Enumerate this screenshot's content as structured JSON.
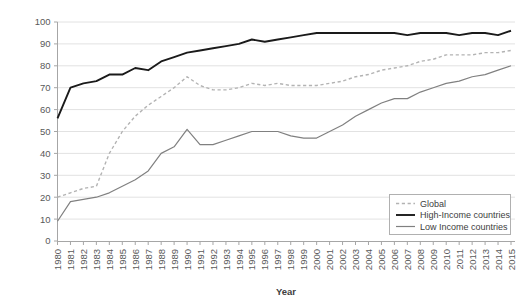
{
  "chart_data": {
    "type": "line",
    "title": "",
    "xlabel": "Year",
    "ylabel": "",
    "ylim": [
      0,
      100
    ],
    "ytick_step": 10,
    "yticks": [
      0,
      10,
      20,
      30,
      40,
      50,
      60,
      70,
      80,
      90,
      100
    ],
    "grid": true,
    "legend_position": "bottom-right",
    "x": [
      1980,
      1981,
      1982,
      1983,
      1984,
      1985,
      1986,
      1987,
      1988,
      1989,
      1990,
      1991,
      1992,
      1993,
      1994,
      1995,
      1996,
      1997,
      1998,
      1999,
      2000,
      2001,
      2002,
      2003,
      2004,
      2005,
      2006,
      2007,
      2008,
      2009,
      2010,
      2011,
      2012,
      2013,
      2014,
      2015
    ],
    "categories": [
      "1980",
      "1981",
      "1982",
      "1983",
      "1984",
      "1985",
      "1986",
      "1987",
      "1988",
      "1989",
      "1990",
      "1991",
      "1992",
      "1993",
      "1994",
      "1995",
      "1996",
      "1997",
      "1998",
      "1999",
      "2000",
      "2001",
      "2002",
      "2003",
      "2004",
      "2005",
      "2006",
      "2007",
      "2008",
      "2009",
      "2010",
      "2011",
      "2012",
      "2013",
      "2014",
      "2015"
    ],
    "series": [
      {
        "name": "Global",
        "style": "dashed",
        "color": "#b3b3b3",
        "width": 1.4,
        "values": [
          20,
          22,
          24,
          25,
          40,
          50,
          57,
          62,
          66,
          70,
          75,
          71,
          69,
          69,
          70,
          72,
          71,
          72,
          71,
          71,
          71,
          72,
          73,
          75,
          76,
          78,
          79,
          80,
          82,
          83,
          85,
          85,
          85,
          86,
          86,
          87
        ]
      },
      {
        "name": "High-Income countries",
        "style": "solid",
        "color": "#1a1a1a",
        "width": 1.9,
        "values": [
          56,
          70,
          72,
          73,
          76,
          76,
          79,
          78,
          82,
          84,
          86,
          87,
          88,
          89,
          90,
          92,
          91,
          92,
          93,
          94,
          95,
          95,
          95,
          95,
          95,
          95,
          95,
          94,
          95,
          95,
          95,
          94,
          95,
          95,
          94,
          96
        ]
      },
      {
        "name": "Low Income countries",
        "style": "solid",
        "color": "#808080",
        "width": 1.2,
        "values": [
          9,
          18,
          19,
          20,
          22,
          25,
          28,
          32,
          40,
          43,
          51,
          44,
          44,
          46,
          48,
          50,
          50,
          50,
          48,
          47,
          47,
          50,
          53,
          57,
          60,
          63,
          65,
          65,
          68,
          70,
          72,
          73,
          75,
          76,
          78,
          80
        ]
      }
    ]
  },
  "legend": {
    "items": [
      {
        "label": "Global"
      },
      {
        "label": "High-Income countries"
      },
      {
        "label": "Low Income countries"
      }
    ]
  },
  "axes": {
    "x_title": "Year"
  },
  "colors": {
    "global": "#b3b3b3",
    "high_income": "#1a1a1a",
    "low_income": "#808080",
    "gridline": "#e2e2e2",
    "axis": "#a6a6a6",
    "text": "#595959"
  }
}
